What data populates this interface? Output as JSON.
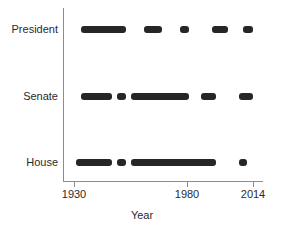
{
  "chart_data": {
    "type": "scatter",
    "title": "",
    "xlabel": "Year",
    "ylabel": "",
    "grid": false,
    "legend": "none",
    "xlim": [
      1930,
      2014
    ],
    "xticks": [
      1930,
      1980,
      2014
    ],
    "xticklabels": [
      "1930",
      "1980",
      "2014"
    ],
    "categories": [
      "President",
      "Senate",
      "House"
    ],
    "series": [
      {
        "name": "President",
        "category": "President",
        "marker_color": "#262626",
        "intervals": [
          [
            1933,
            1953
          ],
          [
            1961,
            1969
          ],
          [
            1977,
            1981
          ],
          [
            1993,
            2001
          ],
          [
            2009,
            2014
          ]
        ]
      },
      {
        "name": "Senate",
        "category": "Senate",
        "marker_color": "#262626",
        "intervals": [
          [
            1933,
            1947
          ],
          [
            1949,
            1953
          ],
          [
            1955,
            1981
          ],
          [
            1987,
            1995
          ],
          [
            2007,
            2014
          ]
        ]
      },
      {
        "name": "House",
        "category": "House",
        "marker_color": "#262626",
        "intervals": [
          [
            1931,
            1947
          ],
          [
            1949,
            1953
          ],
          [
            1955,
            1995
          ],
          [
            2007,
            2011
          ]
        ]
      }
    ]
  },
  "axis": {
    "x_title": "Year",
    "ticks": [
      {
        "label": "1930",
        "value": 1930
      },
      {
        "label": "1980",
        "value": 1980
      },
      {
        "label": "2014",
        "value": 2014
      }
    ],
    "category_labels": [
      {
        "label": "President"
      },
      {
        "label": "Senate"
      },
      {
        "label": "House"
      }
    ]
  },
  "colors": {
    "marker": "#262626",
    "axis": "#8c8c8c",
    "text": "#2b2b2b",
    "background": "#ffffff"
  }
}
